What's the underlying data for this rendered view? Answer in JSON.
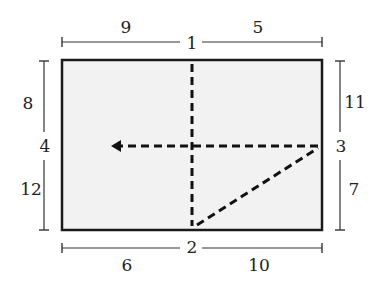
{
  "diagram": {
    "colors": {
      "stroke": "#1a1a1a",
      "fill": "#f2f2f2",
      "dim_line": "#333333",
      "text": "#222222"
    },
    "rectangle": {
      "x": 62,
      "y": 60,
      "width": 260,
      "height": 170
    },
    "edge_labels": {
      "top": "1",
      "bottom": "2",
      "right": "3",
      "left": "4"
    },
    "segment_labels": {
      "top_left": "9",
      "top_right": "5",
      "bottom_left": "6",
      "bottom_right": "10",
      "left_top": "8",
      "left_bottom": "12",
      "right_top": "11",
      "right_bottom": "7"
    },
    "dashed_paths": [
      {
        "name": "vertical-fold",
        "from": [
          192,
          62
        ],
        "to": [
          192,
          226
        ]
      },
      {
        "name": "horizontal-arrow",
        "from": [
          318,
          146
        ],
        "to": [
          118,
          146
        ],
        "arrow": "left"
      },
      {
        "name": "diagonal-fold",
        "from": [
          196,
          226
        ],
        "to": [
          318,
          148
        ]
      }
    ]
  }
}
